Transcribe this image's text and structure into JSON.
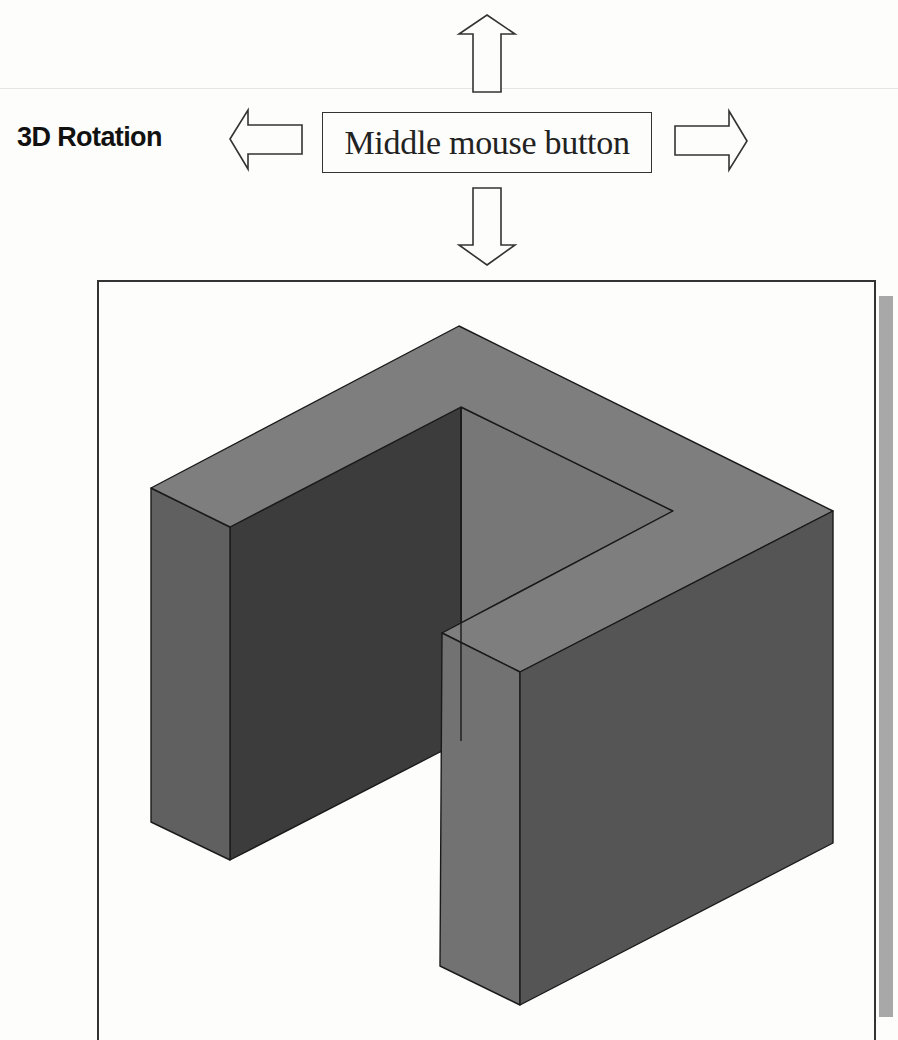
{
  "figure": {
    "label": "3D Rotation",
    "control_box": {
      "text": "Middle mouse button"
    },
    "arrows": [
      {
        "direction": "up",
        "icon": "arrow-up-icon"
      },
      {
        "direction": "left",
        "icon": "arrow-left-icon"
      },
      {
        "direction": "right",
        "icon": "arrow-right-icon"
      },
      {
        "direction": "down",
        "icon": "arrow-down-icon"
      }
    ],
    "viewport": {
      "content": "isometric U-shaped solid model",
      "colors": {
        "top_face": "#7d7d7d",
        "left_outer_face": "#5f5f5f",
        "inner_dark_face": "#3e3e3e",
        "inner_back_face": "#767676",
        "front_face": "#6f6f6f",
        "right_face": "#555555",
        "edge": "#1a1a1a",
        "frame_shadow": "#a8a8a8"
      }
    }
  }
}
